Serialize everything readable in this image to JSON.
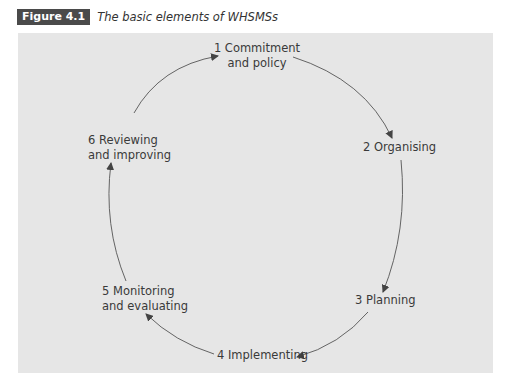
{
  "figure": {
    "label": "Figure 4.1",
    "title": "The basic elements of WHSMSs"
  },
  "diagram": {
    "type": "cycle",
    "colors": {
      "panel": "#e6e6e6",
      "label_bg": "#4a4a4a",
      "arrow": "#444444",
      "text": "#3a3a3a"
    },
    "nodes": [
      {
        "id": 1,
        "line1": "1 Commitment",
        "line2": "and policy"
      },
      {
        "id": 2,
        "line1": "2 Organising"
      },
      {
        "id": 3,
        "line1": "3 Planning"
      },
      {
        "id": 4,
        "line1": "4 Implementing"
      },
      {
        "id": 5,
        "line1": "5 Monitoring",
        "line2": "and evaluating"
      },
      {
        "id": 6,
        "line1": "6 Reviewing",
        "line2": "and improving"
      }
    ],
    "edges": [
      {
        "from": 1,
        "to": 2
      },
      {
        "from": 2,
        "to": 3
      },
      {
        "from": 3,
        "to": 4
      },
      {
        "from": 4,
        "to": 5
      },
      {
        "from": 5,
        "to": 6
      },
      {
        "from": 6,
        "to": 1
      }
    ]
  }
}
